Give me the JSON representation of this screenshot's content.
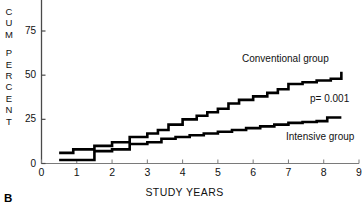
{
  "panel": {
    "letter": "B"
  },
  "axes": {
    "ylabel_text": "CUM PERCENT",
    "ylabel_lines": [
      "C",
      "U",
      "M",
      "",
      "P",
      "E",
      "R",
      "C",
      "E",
      "N",
      "T"
    ],
    "xlabel": "STUDY YEARS",
    "yticks": [
      0,
      25,
      50,
      75
    ],
    "ytick_labels": [
      "0",
      "25",
      "50",
      "75"
    ],
    "xticks": [
      0,
      1,
      2,
      3,
      4,
      5,
      6,
      7,
      8,
      9
    ],
    "xtick_labels": [
      "0",
      "1",
      "2",
      "3",
      "4",
      "5",
      "6",
      "7",
      "8",
      "9"
    ],
    "ylim": [
      0,
      85
    ],
    "xlim": [
      0,
      9
    ],
    "grid": false
  },
  "annotations": {
    "conventional_label": "Conventional group",
    "intensive_label": "Intensive group",
    "pvalue": "p= 0.001"
  },
  "colors": {
    "line": "#000000",
    "axis": "#444444",
    "text": "#111111",
    "background": "#ffffff"
  },
  "chart_data": {
    "type": "line",
    "title": "",
    "subtitle": "",
    "xlabel": "STUDY YEARS",
    "ylabel": "CUM PERCENT",
    "xlim": [
      0,
      9
    ],
    "ylim": [
      0,
      85
    ],
    "grid": false,
    "legend_position": "inline-annotation",
    "step": "post",
    "annotations": [
      {
        "text": "Conventional group",
        "x": 6.6,
        "y": 62
      },
      {
        "text": "Intensive group",
        "x": 7.8,
        "y": 18
      },
      {
        "text": "p= 0.001",
        "x": 8.2,
        "y": 36
      }
    ],
    "series": [
      {
        "name": "Conventional group",
        "x": [
          0.5,
          0.9,
          1.5,
          2.0,
          2.5,
          3.0,
          3.3,
          3.6,
          4.0,
          4.4,
          4.7,
          5.0,
          5.3,
          5.6,
          6.0,
          6.4,
          6.7,
          7.0,
          7.4,
          7.8,
          8.2,
          8.5
        ],
        "values": [
          6,
          8,
          10,
          12,
          15,
          17,
          19,
          22,
          25,
          27,
          29,
          31,
          34,
          36,
          38,
          40,
          42,
          45,
          46,
          47,
          48,
          52
        ]
      },
      {
        "name": "Intensive group",
        "x": [
          0.5,
          0.9,
          1.5,
          2.0,
          2.5,
          3.0,
          3.4,
          3.8,
          4.2,
          4.6,
          5.0,
          5.4,
          5.8,
          6.2,
          6.6,
          7.0,
          7.4,
          7.8,
          8.1,
          8.5
        ],
        "values": [
          2,
          2,
          7,
          8,
          11,
          12,
          14,
          15,
          16,
          17,
          18,
          19,
          20,
          21,
          22,
          23,
          23.5,
          24,
          26,
          26
        ]
      }
    ]
  }
}
